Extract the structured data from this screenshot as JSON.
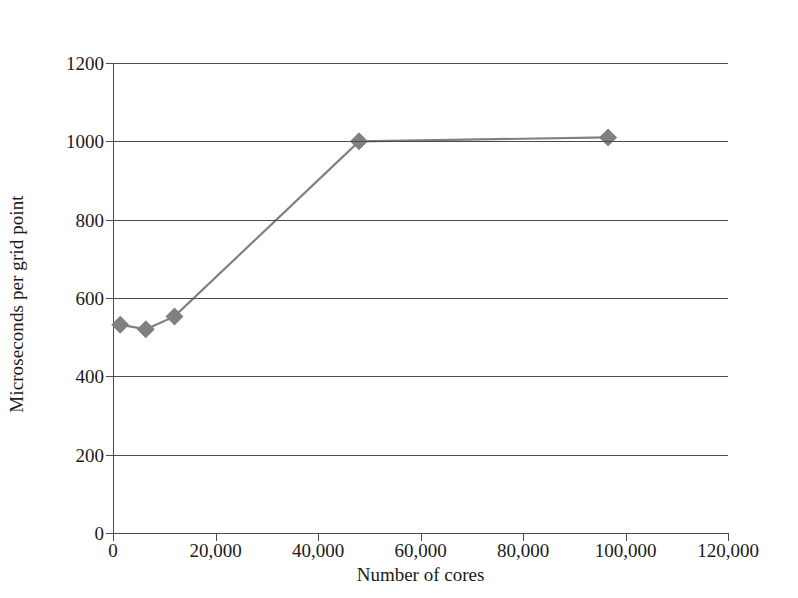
{
  "figure": {
    "clipped_header_text": "",
    "background_color": "#ffffff"
  },
  "chart_data": {
    "type": "line",
    "title": "",
    "xlabel": "Number of cores",
    "ylabel": "Microseconds per grid point",
    "xlim": [
      0,
      120000
    ],
    "ylim": [
      0,
      1200
    ],
    "grid": "horizontal",
    "legend": "none",
    "series_color": "#808080",
    "axis_color": "#4a4a4a",
    "marker": "diamond",
    "xticks": [
      0,
      20000,
      40000,
      60000,
      80000,
      100000,
      120000
    ],
    "xticklabels": [
      "0",
      "20,000",
      "40,000",
      "60,000",
      "80,000",
      "100,000",
      "120,000"
    ],
    "yticks": [
      0,
      200,
      400,
      600,
      800,
      1000,
      1200
    ],
    "yticklabels": [
      "0",
      "200",
      "400",
      "600",
      "800",
      "1000",
      "1200"
    ],
    "series": [
      {
        "name": "Microseconds per grid point",
        "x": [
          1400,
          6400,
          12000,
          48000,
          96600
        ],
        "y": [
          532,
          520,
          553,
          1000,
          1010
        ]
      }
    ]
  }
}
